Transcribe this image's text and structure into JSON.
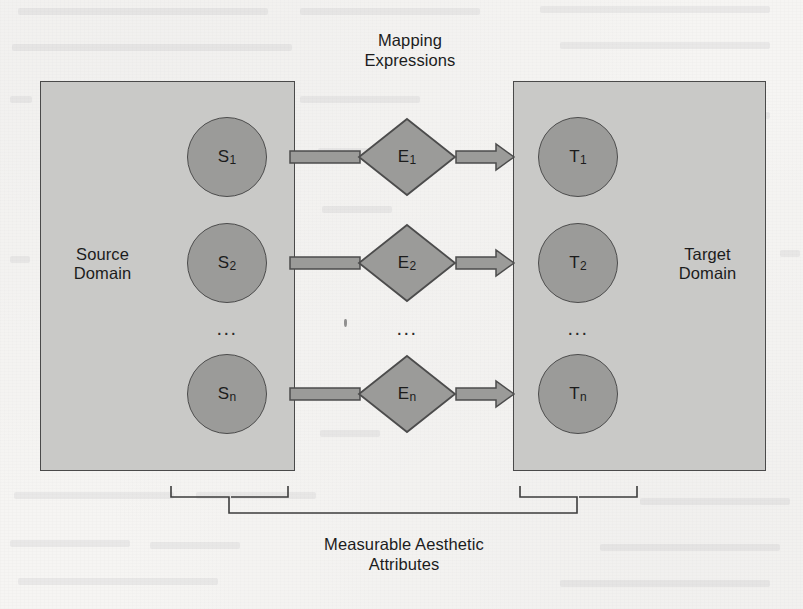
{
  "figure": {
    "title_top": "Mapping\nExpressions",
    "caption_bottom": "Measurable Aesthetic\nAttributes",
    "source_domain_label": "Source\nDomain",
    "target_domain_label": "Target\nDomain",
    "ellipsis": "..."
  },
  "colors": {
    "page_background": "#f6f5f3",
    "domain_box_fill": "#c9c9c7",
    "node_fill": "#9b9b99",
    "outline": "#4a4a4a",
    "text": "#1c1c1c"
  },
  "source_nodes": [
    {
      "base": "S",
      "sub": "1"
    },
    {
      "base": "S",
      "sub": "2"
    },
    {
      "base": "S",
      "sub": "n"
    }
  ],
  "expression_nodes": [
    {
      "base": "E",
      "sub": "1"
    },
    {
      "base": "E",
      "sub": "2"
    },
    {
      "base": "E",
      "sub": "n"
    }
  ],
  "target_nodes": [
    {
      "base": "T",
      "sub": "1"
    },
    {
      "base": "T",
      "sub": "2"
    },
    {
      "base": "T",
      "sub": "n"
    }
  ],
  "icons": {
    "arrow_right": "arrow-right-icon",
    "diamond": "diamond-shape-icon",
    "circle": "circle-node-icon",
    "bracket": "curly-bracket-icon"
  }
}
